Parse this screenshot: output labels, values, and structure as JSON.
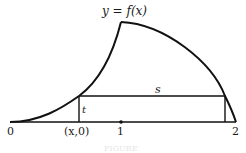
{
  "diagram": {
    "function_label": "y = f(x)",
    "axis_labels": {
      "origin": "0",
      "x_point": "(x,0)",
      "one": "1",
      "two": "2"
    },
    "segment_labels": {
      "horizontal": "s",
      "vertical": "t"
    },
    "caption": "FIGURE",
    "colors": {
      "stroke": "#111111",
      "background": "#ffffff"
    }
  }
}
